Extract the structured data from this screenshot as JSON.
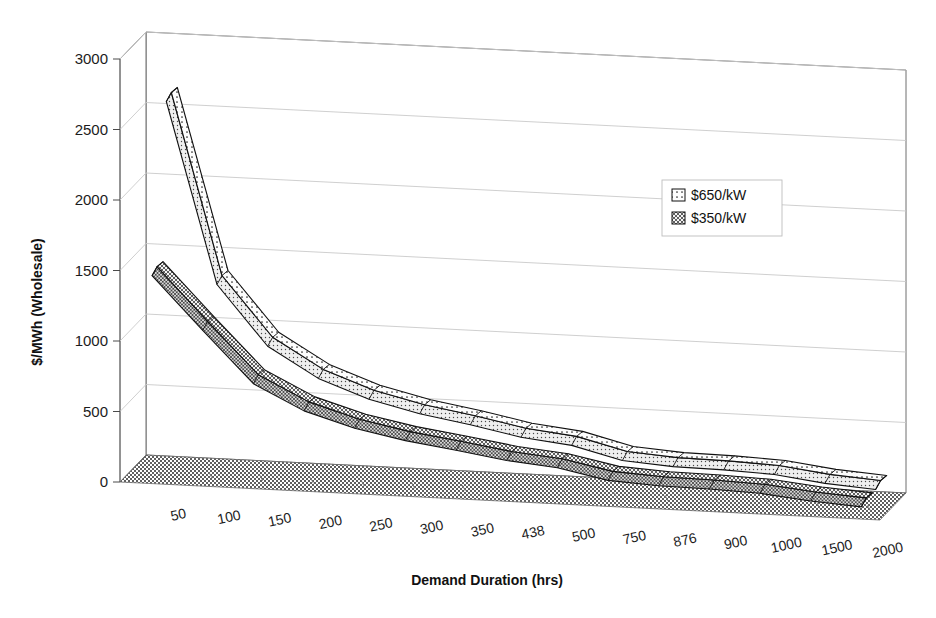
{
  "chart_data": {
    "type": "line",
    "title": "",
    "subtitle": "",
    "xlabel": "Demand Duration (hrs)",
    "ylabel": "$/MWh (Wholesale)",
    "projection": "3d",
    "grid": true,
    "legend_position": "upper-right",
    "ylim": [
      0,
      3000
    ],
    "yticks": [
      0,
      500,
      1000,
      1500,
      2000,
      2500,
      3000
    ],
    "categories": [
      "50",
      "100",
      "150",
      "200",
      "250",
      "300",
      "350",
      "438",
      "500",
      "750",
      "876",
      "900",
      "1000",
      "1500",
      "2000"
    ],
    "series": [
      {
        "name": "$650/kW",
        "fill": "dotted",
        "color": "#fbfbfb",
        "values": [
          2580,
          1300,
          880,
          670,
          540,
          455,
          395,
          325,
          285,
          195,
          170,
          165,
          150,
          105,
          80
        ]
      },
      {
        "name": "$350/kW",
        "fill": "crosshatch",
        "color": "#e8e8e8",
        "values": [
          1450,
          1080,
          720,
          545,
          440,
          370,
          320,
          265,
          232,
          160,
          140,
          135,
          122,
          85,
          62
        ]
      }
    ]
  },
  "axes": {
    "y_tick_labels": [
      "3000",
      "2500",
      "2000",
      "1500",
      "1000",
      "500",
      "0"
    ],
    "y_axis_title": "$/MWh (Wholesale)",
    "x_axis_title": "Demand Duration (hrs)",
    "x_tick_labels": [
      "50",
      "100",
      "150",
      "200",
      "250",
      "300",
      "350",
      "438",
      "500",
      "750",
      "876",
      "900",
      "1000",
      "1500",
      "2000"
    ]
  },
  "legend": {
    "entries": [
      {
        "label": "$650/kW",
        "swatch": "dotted-swatch"
      },
      {
        "label": "$350/kW",
        "swatch": "crosshatch-swatch"
      }
    ]
  },
  "colors": {
    "floor": "#6b6b6b",
    "wall_line": "#6e6e6e",
    "grid": "#c9c9c9",
    "text": "#1c1c1c",
    "ribbon_stroke": "#111111"
  }
}
